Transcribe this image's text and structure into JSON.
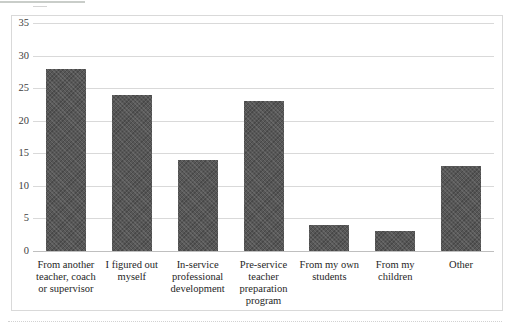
{
  "chart_data": {
    "type": "bar",
    "title": "",
    "categories": [
      "From another teacher, coach or supervisor",
      "I figured out myself",
      "In-service professional development",
      "Pre-service teacher preparation program",
      "From my own students",
      "From my children",
      "Other"
    ],
    "category_lines": [
      [
        "From another",
        "teacher, coach",
        "or supervisor"
      ],
      [
        "I figured out",
        "myself"
      ],
      [
        "In-service",
        "professional",
        "development"
      ],
      [
        "Pre-service",
        "teacher",
        "preparation",
        "program"
      ],
      [
        "From my own",
        "students"
      ],
      [
        "From my",
        "children"
      ],
      [
        "Other"
      ]
    ],
    "values": [
      28,
      24,
      14,
      23,
      4,
      3,
      13
    ],
    "series": [
      {
        "name": "Responses",
        "values": [
          28,
          24,
          14,
          23,
          4,
          3,
          13
        ]
      }
    ],
    "xlabel": "",
    "ylabel": "",
    "ylim": [
      0,
      35
    ],
    "yticks": [
      0,
      5,
      10,
      15,
      20,
      25,
      30,
      35
    ],
    "grid": true,
    "legend": false,
    "colors": {
      "bar_fill": "#575757",
      "bar_pattern_light": "rgba(255,255,255,0.10)",
      "bar_pattern_dark": "rgba(0,0,0,0.18)",
      "gridline": "#d9d9d9",
      "axis_line": "#bfbfbf",
      "tick_label": "#404040",
      "category_label": "#262626",
      "frame_border": "#d9d9d9",
      "background": "#ffffff"
    }
  }
}
